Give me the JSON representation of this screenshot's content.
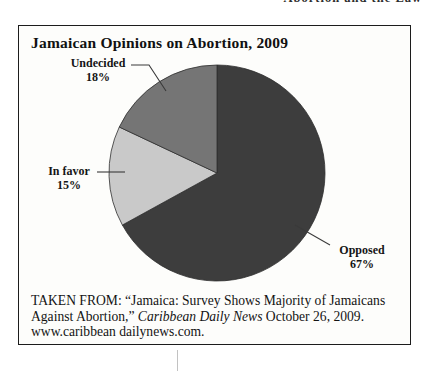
{
  "page": {
    "header_fragment": "Abortion and the Law"
  },
  "figure": {
    "title": "Jamaican Opinions on Abortion, 2009",
    "caption": {
      "part1": "TAKEN FROM: “Jamaica: Survey Shows Majority of Jamaicans Against Abortion,” ",
      "italic": "Caribbean Daily News",
      "part2": " October 26, 2009. www.caribbean dailynews.com."
    }
  },
  "chart_data": {
    "type": "pie",
    "title": "Jamaican Opinions on Abortion, 2009",
    "start_angle_deg": 0,
    "direction": "clockwise",
    "legend_position": "callouts",
    "slices": [
      {
        "id": "opposed",
        "label": "Opposed",
        "value": 67,
        "pct_label": "67%",
        "color": "#3d3d3d"
      },
      {
        "id": "in-favor",
        "label": "In favor",
        "value": 15,
        "pct_label": "15%",
        "color": "#c9c9c9"
      },
      {
        "id": "undecided",
        "label": "Undecided",
        "value": 18,
        "pct_label": "18%",
        "color": "#757575"
      }
    ]
  }
}
